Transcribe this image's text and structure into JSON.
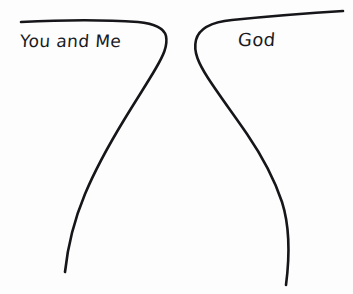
{
  "image": {
    "kind": "hand-drawn-diagram",
    "background_color": "#fdfdfd",
    "ink_color": "#16161a",
    "width": 353,
    "height": 294
  },
  "labels": {
    "left": "You and Me",
    "right": "God"
  },
  "strokes": {
    "left_curve_name": "left-hand-drawn-curve",
    "right_curve_name": "right-hand-drawn-curve"
  }
}
